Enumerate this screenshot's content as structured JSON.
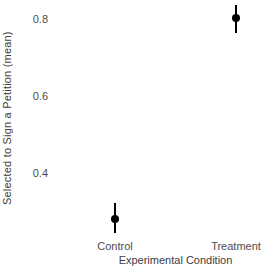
{
  "chart_data": {
    "type": "scatter",
    "title": "",
    "xlabel": "Experimental Condition",
    "ylabel": "Selected to Sign a Petition (mean)",
    "categories": [
      "Control",
      "Treatment"
    ],
    "series": [
      {
        "name": "mean-with-95ci",
        "values": [
          0.28,
          0.805
        ],
        "error_low": [
          0.245,
          0.765
        ],
        "error_high": [
          0.322,
          0.84
        ]
      }
    ],
    "yticks": [
      {
        "label": "0.4",
        "value": 0.4
      },
      {
        "label": "0.6",
        "value": 0.6
      },
      {
        "label": "0.8",
        "value": 0.8
      }
    ],
    "ylim": [
      0.236,
      0.852
    ],
    "grid": false,
    "legend": false,
    "axis_lines": false,
    "point_color": "#000000",
    "errorbar_color": "#000000",
    "axis_text_color": "#4d4d4d",
    "axis_title_color": "#404040",
    "background_color": "#ffffff"
  }
}
